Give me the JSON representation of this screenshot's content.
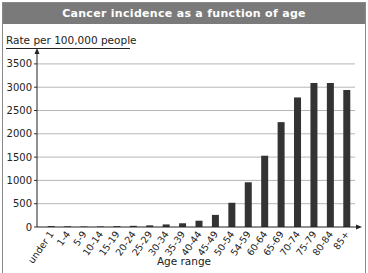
{
  "chart_data": {
    "type": "bar",
    "title": "Cancer incidence as a function of age",
    "ylabel": "Rate per 100,000 people",
    "xlabel": "Age range",
    "ylim": [
      0,
      3800
    ],
    "yticks": [
      0,
      500,
      1000,
      1500,
      2000,
      2500,
      3000,
      3500
    ],
    "grid": true,
    "legend": null,
    "categories": [
      "under 1",
      "1-4",
      "5-9",
      "10-14",
      "15-19",
      "20-24",
      "25-29",
      "30-34",
      "35-39",
      "40-44",
      "45-49",
      "50-54",
      "54-59",
      "60-64",
      "65-69",
      "70-74",
      "75-79",
      "80-84",
      "85+"
    ],
    "values": [
      20,
      15,
      10,
      12,
      18,
      25,
      35,
      55,
      80,
      135,
      260,
      520,
      960,
      1530,
      2250,
      2780,
      3090,
      3090,
      2940
    ],
    "bar_color": "#333333"
  }
}
